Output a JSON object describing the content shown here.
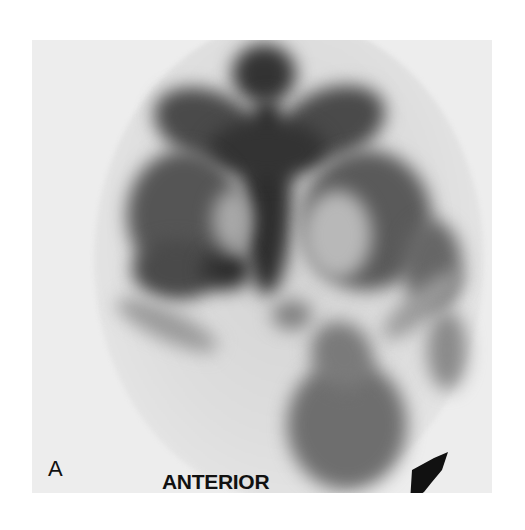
{
  "figure": {
    "panel_label": "A",
    "view_label": "ANTERIOR",
    "arrow": {
      "direction": "down-left",
      "color": "#111111"
    },
    "colors": {
      "background": "#ffffff",
      "frame": "#ededed",
      "uptake_dark": "#2a2a2a",
      "uptake_mid": "#6a6a6a"
    }
  }
}
